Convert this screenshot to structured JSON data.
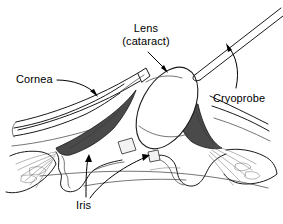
{
  "figure": {
    "type": "anatomical-line-diagram",
    "background_color": "#ffffff",
    "line_color": "#1a1a1a",
    "shadow_fill_color": "#4a4a4a",
    "lens_fill_color": "#ffffff"
  },
  "labels": {
    "cornea": "Cornea",
    "lens_line1": "Lens",
    "lens_line2": "(cataract)",
    "cryoprobe": "Cryoprobe",
    "iris": "Iris"
  },
  "parts": [
    {
      "name": "cornea",
      "label": "Cornea",
      "description": "Outer transparent dome, drawn as double contour lines across the upper left of the eye"
    },
    {
      "name": "lens",
      "label": "Lens (cataract)",
      "description": "Large tilted white ellipse at the centre being extracted"
    },
    {
      "name": "cryoprobe",
      "label": "Cryoprobe",
      "description": "Thin double-line instrument shaft entering from upper right and frozen onto the lens"
    },
    {
      "name": "iris",
      "label": "Iris",
      "description": "Wavy structures flanking the lens on both sides"
    }
  ],
  "leaders": [
    {
      "from": "cornea",
      "target": "cornea-surface",
      "style": "curved-arrow"
    },
    {
      "from": "lens",
      "target": "lens-capsule",
      "style": "straight-arrow"
    },
    {
      "from": "cryoprobe",
      "target": "probe-shaft",
      "style": "curved-arrow"
    },
    {
      "from": "iris",
      "target": "left-iris",
      "style": "straight-arrow"
    },
    {
      "from": "iris",
      "target": "right-iris",
      "style": "long-curved-arrow"
    }
  ]
}
